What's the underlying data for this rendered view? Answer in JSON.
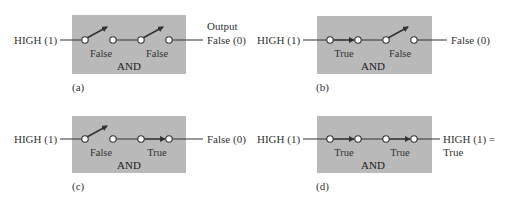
{
  "colors": {
    "box": "#b9b9b9",
    "line": "#333333",
    "circle_fill": "#ffffff"
  },
  "panels": [
    {
      "id": "a",
      "caption": "(a)",
      "input_label": "HIGH (1)",
      "output_header": "Output",
      "output_label": "False (0)",
      "output_label2": "",
      "gate_label": "AND",
      "switches": [
        {
          "state": "open",
          "label": "False"
        },
        {
          "state": "open",
          "label": "False"
        }
      ]
    },
    {
      "id": "b",
      "caption": "(b)",
      "input_label": "HIGH (1)",
      "output_header": "",
      "output_label": "False (0)",
      "output_label2": "",
      "gate_label": "AND",
      "switches": [
        {
          "state": "closed",
          "label": "True"
        },
        {
          "state": "open",
          "label": "False"
        }
      ]
    },
    {
      "id": "c",
      "caption": "(c)",
      "input_label": "HIGH (1)",
      "output_header": "",
      "output_label": "False (0)",
      "output_label2": "",
      "gate_label": "AND",
      "switches": [
        {
          "state": "open",
          "label": "False"
        },
        {
          "state": "closed",
          "label": "True"
        }
      ]
    },
    {
      "id": "d",
      "caption": "(d)",
      "input_label": "HIGH (1)",
      "output_header": "",
      "output_label": "HIGH (1) =",
      "output_label2": "True",
      "gate_label": "AND",
      "switches": [
        {
          "state": "closed",
          "label": "True"
        },
        {
          "state": "closed",
          "label": "True"
        }
      ]
    }
  ]
}
